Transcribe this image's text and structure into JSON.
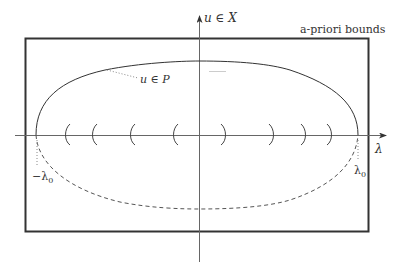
{
  "diagram": {
    "colors": {
      "background": "#ffffff",
      "stroke": "#333333",
      "light_stroke": "#888888"
    },
    "axes": {
      "vertical_label": "u ∈ X",
      "horizontal_label": "λ"
    },
    "box": {
      "label": "a-priori bounds"
    },
    "curve": {
      "solid_label": "u ∈ P",
      "left_endpoint_label": "−λ0",
      "right_endpoint_label": "λ0",
      "left_endpoint_base": "−λ",
      "left_endpoint_sub": "0",
      "right_endpoint_base": "λ",
      "right_endpoint_sub": "0"
    },
    "bifurcation_marks": {
      "left_count": 5,
      "right_count": 5
    }
  }
}
